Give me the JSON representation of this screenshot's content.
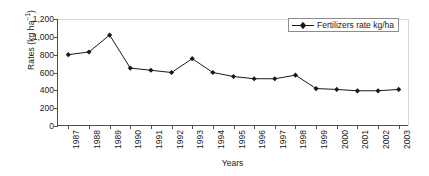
{
  "chart_data": {
    "type": "line",
    "title": "",
    "xlabel": "Years",
    "ylabel": "Rates (kg ha-1)",
    "ylabel_base": "Rates (kg ha",
    "ylabel_exponent": "−1",
    "ylabel_close": ")",
    "categories": [
      "1987",
      "1988",
      "1989",
      "1990",
      "1991",
      "1992",
      "1993",
      "1994",
      "1995",
      "1996",
      "1997",
      "1998",
      "1999",
      "2000",
      "2001",
      "2002",
      "2003"
    ],
    "series": [
      {
        "name": "Fertilizers rate kg/ha",
        "values": [
          800,
          830,
          1020,
          650,
          625,
          600,
          755,
          600,
          555,
          530,
          530,
          570,
          420,
          410,
          395,
          395,
          410
        ],
        "marker": "diamond",
        "color": "#1a1a1a"
      }
    ],
    "ylim": [
      0,
      1200
    ],
    "ytick_values": [
      0,
      200,
      400,
      600,
      800,
      1000,
      1200
    ],
    "ytick_labels": [
      "0",
      "200",
      "400",
      "600",
      "800",
      "1,000",
      "1,200"
    ],
    "grid": false,
    "legend_position": "top-right",
    "legend_entries": [
      "Fertilizers rate kg/ha"
    ]
  }
}
